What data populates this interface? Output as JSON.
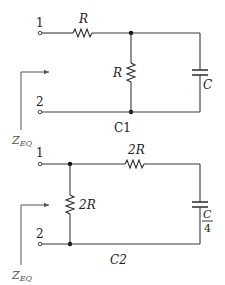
{
  "circuits": [
    {
      "name": "C1",
      "caption": "C1",
      "terminals": {
        "top": "1",
        "bottom": "2"
      },
      "series_resistor": "R",
      "shunt_resistor": "R",
      "capacitor": "C",
      "impedance_label": {
        "main": "Z",
        "sub": "EQ"
      }
    },
    {
      "name": "C2",
      "caption": "C2",
      "terminals": {
        "top": "1",
        "bottom": "2"
      },
      "series_resistor": "2R",
      "shunt_resistor": "2R",
      "capacitor": {
        "numerator": "C",
        "denominator": "4"
      },
      "impedance_label": {
        "main": "Z",
        "sub": "EQ"
      }
    }
  ]
}
